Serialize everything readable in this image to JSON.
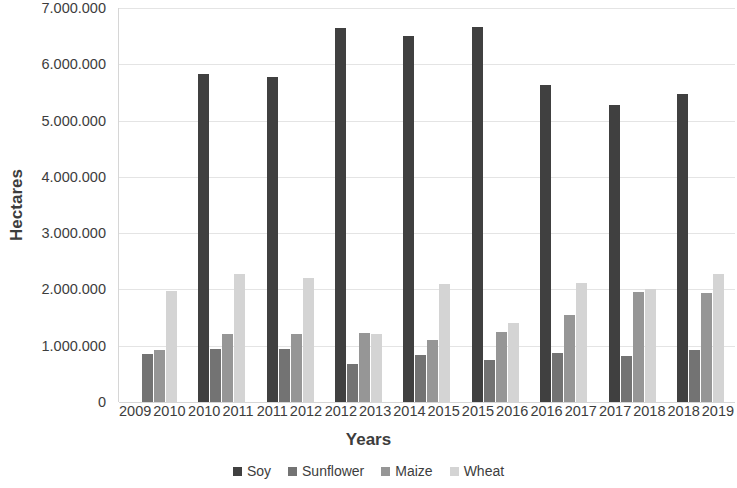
{
  "chart_data": {
    "type": "bar",
    "title": "",
    "xlabel": "Years",
    "ylabel": "Hectares",
    "ylim": [
      0,
      7000000
    ],
    "ytick_step": 1000000,
    "grid": true,
    "legend_position": "bottom",
    "categories": [
      "2009 2010",
      "2010 2011",
      "2011 2012",
      "2012 2013",
      "2014 2015",
      "2015 2016",
      "2016 2017",
      "2017 2018",
      "2018 2019"
    ],
    "category_lines": [
      [
        "2009",
        "2010"
      ],
      [
        "2010",
        "2011"
      ],
      [
        "2011",
        "2012"
      ],
      [
        "2012",
        "2013"
      ],
      [
        "2014",
        "2015"
      ],
      [
        "2015",
        "2016"
      ],
      [
        "2016",
        "2017"
      ],
      [
        "2017",
        "2018"
      ],
      [
        "2018",
        "2019"
      ]
    ],
    "ytick_labels": [
      "0",
      "1.000.000",
      "2.000.000",
      "3.000.000",
      "4.000.000",
      "5.000.000",
      "6.000.000",
      "7.000.000"
    ],
    "ytick_values": [
      0,
      1000000,
      2000000,
      3000000,
      4000000,
      5000000,
      6000000,
      7000000
    ],
    "series": [
      {
        "name": "Soy",
        "color": "#404040",
        "values": [
          0,
          5830000,
          5780000,
          6650000,
          6500000,
          6670000,
          5630000,
          5270000,
          5480000
        ]
      },
      {
        "name": "Sunflower",
        "color": "#737373",
        "values": [
          850000,
          950000,
          940000,
          670000,
          840000,
          740000,
          870000,
          820000,
          930000
        ]
      },
      {
        "name": "Maize",
        "color": "#969696",
        "values": [
          920000,
          1200000,
          1200000,
          1230000,
          1110000,
          1240000,
          1550000,
          1950000,
          1940000
        ]
      },
      {
        "name": "Wheat",
        "color": "#d4d4d4",
        "values": [
          1980000,
          2270000,
          2210000,
          1200000,
          2100000,
          1410000,
          2120000,
          2000000,
          2270000
        ]
      }
    ]
  }
}
